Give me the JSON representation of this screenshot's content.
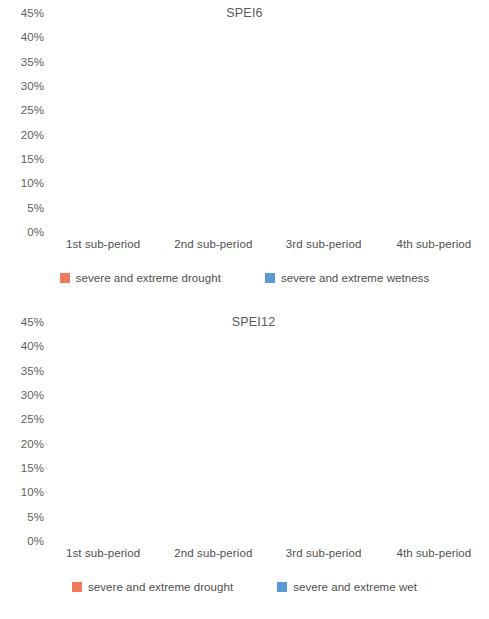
{
  "chart_data": [
    {
      "type": "bar",
      "title": "SPEI6",
      "xlabel": "",
      "ylabel": "",
      "ylim": [
        0,
        45
      ],
      "ytick_labels": [
        "45%",
        "40%",
        "35%",
        "30%",
        "25%",
        "20%",
        "15%",
        "10%",
        "5%",
        "0%"
      ],
      "ytick_values": [
        45,
        40,
        35,
        30,
        25,
        20,
        15,
        10,
        5,
        0
      ],
      "grid": false,
      "legend_position": "bottom",
      "categories": [
        "1st sub-period",
        "2nd sub-period",
        "3rd sub-period",
        "4th sub-period"
      ],
      "series": [
        {
          "name": "severe and extreme drought",
          "color": "#ee7b5e",
          "values": [
            18.7,
            34.2,
            16.0,
            37.0
          ]
        },
        {
          "name": "severe and extreme wetness",
          "color": "#5b9bd5",
          "values": [
            16.0,
            21.5,
            40.0,
            22.0
          ]
        }
      ]
    },
    {
      "type": "bar",
      "title": "SPEI12",
      "xlabel": "",
      "ylabel": "",
      "ylim": [
        0,
        45
      ],
      "ytick_labels": [
        "45%",
        "40%",
        "35%",
        "30%",
        "25%",
        "20%",
        "15%",
        "10%",
        "5%",
        "0%"
      ],
      "ytick_values": [
        45,
        40,
        35,
        30,
        25,
        20,
        15,
        10,
        5,
        0
      ],
      "grid": false,
      "legend_position": "bottom",
      "categories": [
        "1st sub-period",
        "2nd sub-period",
        "3rd sub-period",
        "4th sub-period"
      ],
      "series": [
        {
          "name": "severe and extreme drought",
          "color": "#ee7b5e",
          "values": [
            21.5,
            30.5,
            13.5,
            36.0
          ]
        },
        {
          "name": "severe and extreme wet",
          "color": "#5b9bd5",
          "values": [
            19.0,
            30.0,
            44.0,
            22.0
          ]
        }
      ]
    }
  ]
}
